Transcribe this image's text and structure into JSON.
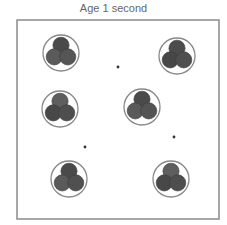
{
  "title": "Age 1 second",
  "colors": {
    "box_border": "#8a8a8a",
    "ring": "#888888",
    "ball_dark": "#4a4a4a",
    "ball_mid": "#5e5e5e",
    "dot": "#333333"
  },
  "box": {
    "x": 17,
    "y": 20,
    "width": 202,
    "height": 199
  },
  "clusters": [
    {
      "id": 1,
      "cx": 61,
      "cy": 53,
      "r": 18,
      "rotation": 0,
      "ball_shades": [
        "#4a4a4a",
        "#5a5a5a",
        "#555555"
      ]
    },
    {
      "id": 2,
      "cx": 177,
      "cy": 56,
      "r": 18,
      "rotation": 0,
      "ball_shades": [
        "#4c4c4c",
        "#474747",
        "#4f4f4f"
      ]
    },
    {
      "id": 3,
      "cx": 60,
      "cy": 109,
      "r": 18,
      "rotation": 0,
      "ball_shades": [
        "#5e5e5e",
        "#484848",
        "#4e4e4e"
      ]
    },
    {
      "id": 4,
      "cx": 142,
      "cy": 107,
      "r": 18,
      "rotation": 0,
      "ball_shades": [
        "#4a4a4a",
        "#5a5a5a",
        "#545454"
      ]
    },
    {
      "id": 5,
      "cx": 69,
      "cy": 179,
      "r": 18,
      "rotation": 0,
      "ball_shades": [
        "#4a4a4a",
        "#5a5a5a",
        "#505050"
      ]
    },
    {
      "id": 6,
      "cx": 171,
      "cy": 179,
      "r": 18,
      "rotation": 0,
      "ball_shades": [
        "#5e5e5e",
        "#484848",
        "#4e4e4e"
      ]
    }
  ],
  "dots": [
    {
      "x": 118,
      "y": 67
    },
    {
      "x": 85,
      "y": 147
    },
    {
      "x": 174,
      "y": 137
    }
  ]
}
